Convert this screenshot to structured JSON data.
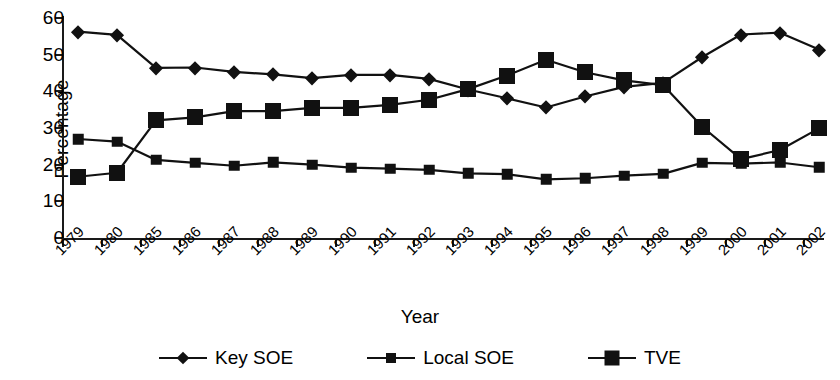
{
  "chart_data": {
    "type": "line",
    "title": "",
    "xlabel": "Year",
    "ylabel": "Percentage",
    "ylim": [
      0,
      60
    ],
    "ytick_values": [
      0,
      10,
      20,
      30,
      40,
      50,
      60
    ],
    "grid": false,
    "legend_position": "bottom",
    "categories": [
      "1979",
      "1980",
      "1985",
      "1986",
      "1987",
      "1988",
      "1989",
      "1990",
      "1991",
      "1992",
      "1993",
      "1994",
      "1995",
      "1996",
      "1997",
      "1998",
      "1999",
      "2000",
      "2001",
      "2002"
    ],
    "series": [
      {
        "name": "Key SOE",
        "marker": "diamond",
        "color": "#111111",
        "values": [
          56.3,
          55.4,
          46.4,
          46.5,
          45.3,
          44.6,
          43.6,
          44.5,
          44.5,
          43.4,
          40.5,
          38.1,
          35.6,
          38.6,
          41.2,
          42.3,
          49.3,
          55.5,
          56.0,
          51.4
        ]
      },
      {
        "name": "Local SOE",
        "marker": "square-small",
        "color": "#111111",
        "values": [
          27.0,
          26.3,
          21.3,
          20.5,
          19.7,
          20.6,
          20.0,
          19.2,
          18.9,
          18.6,
          17.6,
          17.4,
          16.0,
          16.3,
          17.0,
          17.5,
          20.5,
          20.3,
          20.6,
          19.3
        ]
      },
      {
        "name": "TVE",
        "marker": "square-large",
        "color": "#111111",
        "values": [
          16.7,
          17.8,
          32.1,
          32.9,
          34.6,
          34.6,
          35.5,
          35.5,
          36.3,
          37.7,
          40.6,
          44.3,
          48.6,
          45.2,
          43.0,
          41.7,
          30.4,
          21.5,
          24.0,
          29.9
        ]
      }
    ]
  },
  "legend": {
    "items": [
      {
        "label": "Key SOE",
        "marker": "diamond-icon"
      },
      {
        "label": "Local SOE",
        "marker": "square-small-icon"
      },
      {
        "label": "TVE",
        "marker": "square-large-icon"
      }
    ]
  }
}
